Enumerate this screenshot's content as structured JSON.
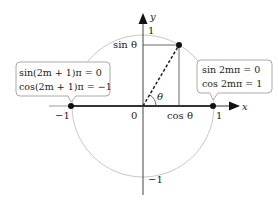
{
  "diagram": {
    "type": "unit-circle",
    "axes": {
      "x_label": "x",
      "y_label": "y",
      "origin_label": "0",
      "x_ticks": [
        "−1",
        "1"
      ],
      "y_ticks": [
        "1",
        "−1"
      ]
    },
    "angle_label": "θ",
    "projection_labels": {
      "sin": "sin θ",
      "cos": "cos θ"
    },
    "callouts": {
      "left": {
        "line1": "sin(2m + 1)π = 0",
        "line2": "cos(2m + 1)π = −1"
      },
      "right": {
        "line1": "sin 2mπ = 0",
        "line2": "cos 2mπ = 1"
      }
    },
    "colors": {
      "circle": "#c8c8c8",
      "axis": "#444444",
      "callout_border": "#aaaaaa",
      "point": "#111111"
    }
  }
}
